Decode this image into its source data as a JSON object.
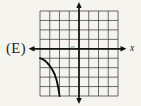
{
  "figure": {
    "option_label": "(E)",
    "origin_label": "0",
    "x_axis_label": "x"
  },
  "colors": {
    "background": "#f5f4ef",
    "grid_line": "#3c3c3c",
    "axis": "#121212",
    "curve": "#0d0d0d",
    "text": "#1c1c1c"
  },
  "chart_data": {
    "type": "line",
    "xlabel": "x",
    "ylabel": "",
    "x_range": [
      -4,
      4
    ],
    "y_range": [
      -5,
      4
    ],
    "grid": true,
    "grid_cells": {
      "columns": 8,
      "rows": 9,
      "y_axis_column": 4,
      "x_axis_row": 4,
      "rows_above_x_axis": 4,
      "rows_below_x_axis": 5
    },
    "axes_style": "arrows on both ends of x-axis and y-axis, origin marked 0",
    "series": [
      {
        "name": "third-quadrant-curve",
        "x": [
          -4.0,
          -3.75,
          -3.5,
          -3.25,
          -3.0,
          -2.75,
          -2.5,
          -2.3,
          -2.15,
          -2.05,
          -2.0
        ],
        "y": [
          -1.0,
          -1.1,
          -1.25,
          -1.5,
          -1.8,
          -2.2,
          -2.7,
          -3.3,
          -4.0,
          -4.6,
          -5.0
        ]
      }
    ],
    "annotations": [
      "curve enters at left edge of grid about 1 unit below x-axis",
      "curve falls steeply to bottom edge of grid about 2 units left of y-axis"
    ]
  }
}
